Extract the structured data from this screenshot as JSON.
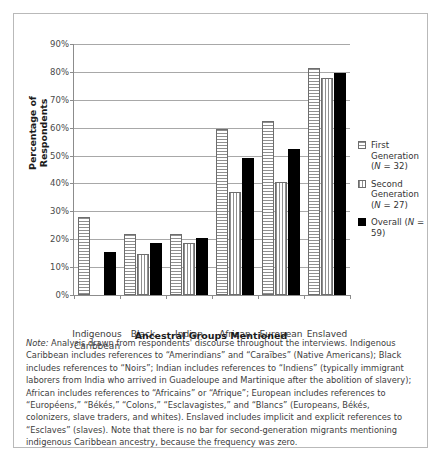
{
  "chart_data": {
    "type": "bar",
    "title": "",
    "xlabel": "Ancestral Groups Mentioned",
    "ylabel": "Percentage of Respondents",
    "ylim": [
      0,
      90
    ],
    "ytick_labels": [
      "0%",
      "10%",
      "20%",
      "30%",
      "40%",
      "50%",
      "60%",
      "70%",
      "80%",
      "90%"
    ],
    "ytick_values": [
      0,
      10,
      20,
      30,
      40,
      50,
      60,
      70,
      80,
      90
    ],
    "grid": "horizontal",
    "legend_position": "right",
    "categories": [
      "Indigenous\nCaribbean",
      "Black",
      "Indian",
      "African",
      "European",
      "Enslaved"
    ],
    "series": [
      {
        "name": "First Generation",
        "n_label": "(N = 32)",
        "fill": "horizontal-hatch",
        "values": [
          28.1,
          21.9,
          21.9,
          59.4,
          62.5,
          81.3
        ]
      },
      {
        "name": "Second Generation",
        "n_label": "(N = 27)",
        "fill": "vertical-hatch",
        "values": [
          0,
          14.8,
          18.5,
          37.0,
          40.7,
          77.8
        ]
      },
      {
        "name": "Overall",
        "n_label": "(N = 59)",
        "fill": "solid-black",
        "values": [
          15.3,
          18.6,
          20.3,
          49.2,
          52.5,
          79.7
        ]
      }
    ],
    "annotations": []
  },
  "legend": {
    "items": [
      {
        "label": "First Generation",
        "sub": "(N = 32)",
        "swatch": "horizontal-hatch-swatch"
      },
      {
        "label": "Second Generation",
        "sub": "(N = 27)",
        "swatch": "vertical-hatch-swatch"
      },
      {
        "label": "Overall (N = 59)",
        "sub": "",
        "swatch": "solid-black-swatch"
      }
    ]
  },
  "note": {
    "label": "Note:",
    "text": " Analysis drawn from respondents' discourse throughout the interviews. Indigenous Caribbean includes references to “Amerindians” and “Caraïbes” (Native Americans); Black includes references to “Noirs”; Indian includes references to “Indiens” (typically immigrant laborers from India who arrived in Guadeloupe and Martinique after the abolition of slavery); African includes references to “Africains” or “Afrique”; European includes references to “Européens,” “Békés,” “Colons,” “Esclavagistes,” and “Blancs” (Europeans, Békés, colonizers, slave traders, and whites). Enslaved includes implicit and explicit references to “Esclaves” (slaves). Note that there is no bar for second-generation migrants mentioning indigenous Caribbean ancestry, because the frequency was zero."
  },
  "colors": {
    "axis": "#8c8c8c",
    "grid": "#a8a8a8",
    "series_overall": "#000000",
    "frame": "#b9b9b9",
    "text": "#3d3d3d"
  }
}
